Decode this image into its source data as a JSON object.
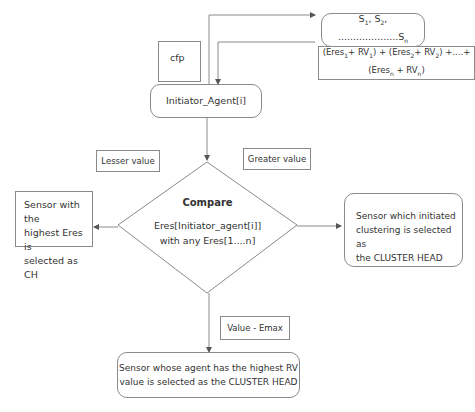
{
  "diagram": {
    "nodes": {
      "sensors": {
        "label": "S1, S2, ................Sn"
      },
      "sum_formula": {
        "label": "(Eres1+ RV1) + (Eres2+ RV2) +.....+ (Eresn + RVn)"
      },
      "cfp": {
        "label": "cfp"
      },
      "initiator": {
        "label": "Initiator_Agent[i]"
      },
      "lesser": {
        "label": "Lesser value"
      },
      "greater": {
        "label": "Greater value"
      },
      "compare_title": {
        "label": "Compare"
      },
      "compare_line1": {
        "label": "Eres[Initiator_agent[i]]"
      },
      "compare_line2": {
        "label": "with any Eres[1....n]"
      },
      "left_result": {
        "line1": "Sensor with the",
        "line2": "highest Eres is",
        "line3": "selected as CH"
      },
      "right_result": {
        "line1": "Sensor which initiated",
        "line2": "clustering is selected as",
        "line3": "the CLUSTER HEAD"
      },
      "value_emax": {
        "label": "Value - Emax"
      },
      "bottom_result": {
        "line1": "Sensor whose agent has the highest RV",
        "line2": "value is selected as the CLUSTER HEAD"
      }
    },
    "colors": {
      "line": "#8a8a8a",
      "text": "#333333"
    }
  }
}
